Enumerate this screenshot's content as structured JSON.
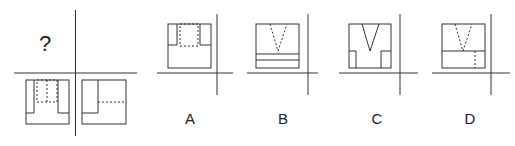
{
  "puzzle": {
    "question_mark": "?",
    "question_panel": {
      "description": "Three-view projection puzzle: front view missing, given top view and side view",
      "top_view_label": "given-view-left",
      "side_view_label": "given-view-right"
    },
    "options": [
      {
        "label": "A"
      },
      {
        "label": "B"
      },
      {
        "label": "C"
      },
      {
        "label": "D"
      }
    ]
  },
  "colors": {
    "stroke": "#333333",
    "text": "#222222",
    "background": "#ffffff"
  }
}
